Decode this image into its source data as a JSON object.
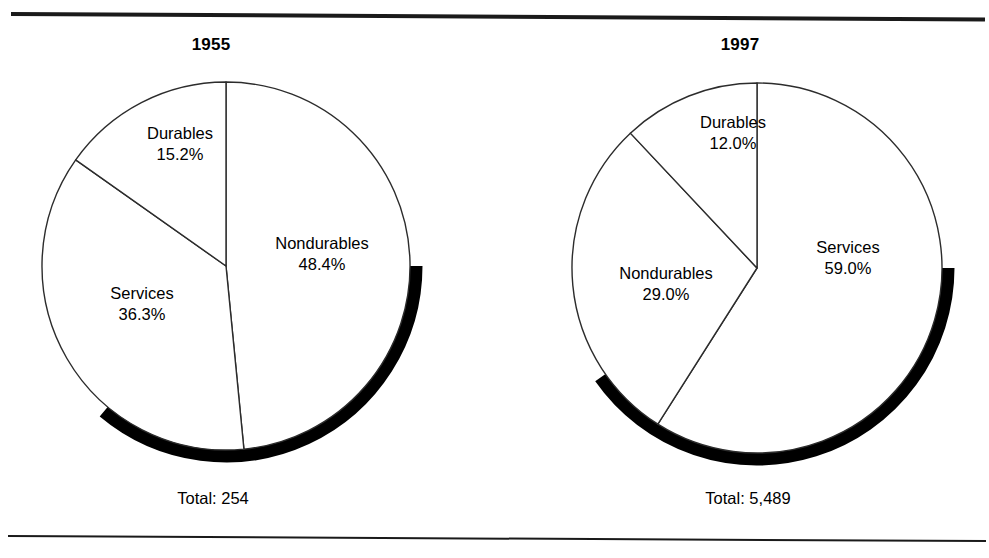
{
  "figure": {
    "panels": [
      {
        "key": "y1955",
        "title": "1955",
        "total_label": "Total: 254",
        "slices": [
          {
            "name": "Nondurables",
            "pct_label": "48.4%",
            "value": 48.4
          },
          {
            "name": "Services",
            "pct_label": "36.3%",
            "value": 36.3
          },
          {
            "name": "Durables",
            "pct_label": "15.2%",
            "value": 15.2
          }
        ]
      },
      {
        "key": "y1997",
        "title": "1997",
        "total_label": "Total: 5,489",
        "slices": [
          {
            "name": "Services",
            "pct_label": "59.0%",
            "value": 59.0
          },
          {
            "name": "Nondurables",
            "pct_label": "29.0%",
            "value": 29.0
          },
          {
            "name": "Durables",
            "pct_label": "12.0%",
            "value": 12.0
          }
        ]
      }
    ],
    "colors": {
      "outline": "#2c2c2c",
      "shadow": "#000000",
      "face": "#ffffff",
      "rule": "#1a1a1a",
      "text": "#000000"
    }
  },
  "chart_data": [
    {
      "type": "pie",
      "title": "1955",
      "categories": [
        "Nondurables",
        "Services",
        "Durables"
      ],
      "values": [
        48.4,
        36.3,
        15.2
      ],
      "value_labels": [
        "48.4%",
        "36.3%",
        "15.2%"
      ],
      "total": 254,
      "total_label": "Total: 254",
      "units": "percent of total",
      "start_angle_deg": 0,
      "direction": "clockwise",
      "legend": "none (direct slice labels)",
      "grid": false
    },
    {
      "type": "pie",
      "title": "1997",
      "categories": [
        "Services",
        "Nondurables",
        "Durables"
      ],
      "values": [
        59.0,
        29.0,
        12.0
      ],
      "value_labels": [
        "59.0%",
        "29.0%",
        "12.0%"
      ],
      "total": 5489,
      "total_label": "Total: 5,489",
      "units": "percent of total",
      "start_angle_deg": 0,
      "direction": "clockwise",
      "legend": "none (direct slice labels)",
      "grid": false
    }
  ]
}
